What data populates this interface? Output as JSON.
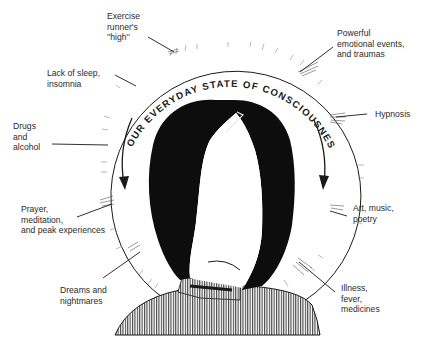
{
  "diagram": {
    "title_arc_text": "OUR EVERYDAY STATE OF CONSCIOUSNESS",
    "colors": {
      "ink": "#1a1a1a",
      "label_text": "#2a2a2a",
      "background": "#ffffff"
    },
    "center_figure": "faceless-woman-silhouette",
    "labels": {
      "exercise": "Exercise\nrunner's\n''high''",
      "lack_of_sleep": "Lack of sleep,\ninsomnia",
      "drugs": "Drugs\nand\nalcohol",
      "prayer": "Prayer,\nmeditation,\nand peak experiences",
      "dreams": "Dreams and\nnightmares",
      "emotional": "Powerful\nemotional events,\nand traumas",
      "hypnosis": "Hypnosis",
      "art": "Art, music,\npoetry",
      "illness": "Illness,\nfever,\nmedicines"
    },
    "arrows": [
      "left-downward-arrow",
      "right-downward-arrow"
    ]
  }
}
